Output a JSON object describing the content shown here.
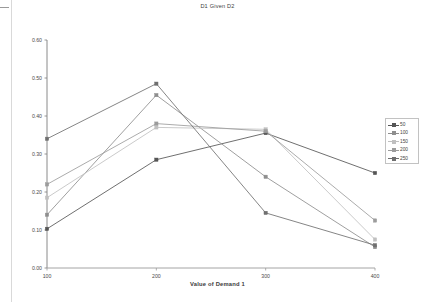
{
  "chart_data": {
    "type": "line",
    "title": "D1 Given D2",
    "xlabel": "Value of Demand 1",
    "ylabel": "",
    "categories": [
      100,
      200,
      300,
      400
    ],
    "category_labels": [
      "100",
      "200",
      "300",
      "400"
    ],
    "ylim": [
      0.0,
      0.6
    ],
    "ytick_labels": [
      "0.00",
      "0.10",
      "0.20",
      "0.30",
      "0.40",
      "0.50",
      "0.60"
    ],
    "ytick_values": [
      0.0,
      0.1,
      0.2,
      0.3,
      0.4,
      0.5,
      0.6
    ],
    "grid": false,
    "legend_position": "right",
    "markers": true,
    "series": [
      {
        "name": "50",
        "values": [
          0.103,
          0.285,
          0.355,
          0.25
        ],
        "color": "#555555"
      },
      {
        "name": "100",
        "values": [
          0.14,
          0.455,
          0.24,
          0.055
        ],
        "color": "#8e8e8e"
      },
      {
        "name": "150",
        "values": [
          0.185,
          0.37,
          0.365,
          0.075
        ],
        "color": "#c0c0c0"
      },
      {
        "name": "200",
        "values": [
          0.22,
          0.38,
          0.36,
          0.125
        ],
        "color": "#9c9c9c"
      },
      {
        "name": "250",
        "values": [
          0.34,
          0.485,
          0.145,
          0.06
        ],
        "color": "#6f6f6f"
      }
    ]
  },
  "legend": {
    "entries": [
      "50",
      "100",
      "150",
      "200",
      "250"
    ]
  },
  "axis": {
    "x_title": "Value of Demand 1",
    "x_labels": [
      "100",
      "200",
      "300",
      "400"
    ],
    "y_labels": [
      "0.60",
      "0.50",
      "0.40",
      "0.30",
      "0.20",
      "0.10",
      "0.00"
    ]
  },
  "header": {
    "title": "D1 Given D2"
  }
}
